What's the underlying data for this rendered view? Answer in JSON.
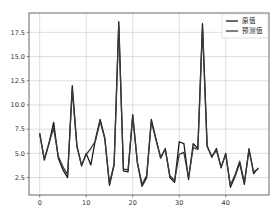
{
  "chart_data": {
    "type": "line",
    "title": "",
    "xlabel": "",
    "ylabel": "",
    "xlim": [
      -2.3,
      49.3
    ],
    "ylim": [
      0.7,
      19.5
    ],
    "grid": true,
    "legend_position": "upper right",
    "x_ticks": [
      0,
      10,
      20,
      30,
      40
    ],
    "x_tick_labels": [
      "0",
      "10",
      "20",
      "30",
      "40"
    ],
    "y_ticks": [
      2.5,
      5.0,
      7.5,
      10.0,
      12.5,
      15.0,
      17.5
    ],
    "y_tick_labels": [
      "2.5",
      "5.0",
      "7.5",
      "10.0",
      "12.5",
      "15.0",
      "17.5"
    ],
    "x": [
      0,
      1,
      2,
      3,
      4,
      5,
      6,
      7,
      8,
      9,
      10,
      11,
      12,
      13,
      14,
      15,
      16,
      17,
      18,
      19,
      20,
      21,
      22,
      23,
      24,
      25,
      26,
      27,
      28,
      29,
      30,
      31,
      32,
      33,
      34,
      35,
      36,
      37,
      38,
      39,
      40,
      41,
      42,
      43,
      44,
      45,
      46,
      47
    ],
    "series": [
      {
        "name": "原值",
        "color": "#1a1a1a",
        "values": [
          7.1,
          4.3,
          6.0,
          8.2,
          4.5,
          3.3,
          2.5,
          12.0,
          5.8,
          3.7,
          5.0,
          3.8,
          6.5,
          8.5,
          6.6,
          1.7,
          3.8,
          18.6,
          3.2,
          3.1,
          9.0,
          4.0,
          1.6,
          2.5,
          8.5,
          6.5,
          4.5,
          5.5,
          2.5,
          2.0,
          6.2,
          6.0,
          2.3,
          6.0,
          5.5,
          18.4,
          5.8,
          4.6,
          5.5,
          3.5,
          5.0,
          1.5,
          2.6,
          4.0,
          1.8,
          5.5,
          2.9,
          3.5
        ]
      },
      {
        "name": "预测值",
        "color": "#3a3a3a",
        "values": [
          7.0,
          4.4,
          6.1,
          7.6,
          4.7,
          3.6,
          2.8,
          11.6,
          5.7,
          3.8,
          4.9,
          5.5,
          6.3,
          8.3,
          6.5,
          1.9,
          3.9,
          18.2,
          3.4,
          3.3,
          8.8,
          4.1,
          1.8,
          2.7,
          8.3,
          6.4,
          4.6,
          5.4,
          2.7,
          2.2,
          4.9,
          5.1,
          2.5,
          5.6,
          5.4,
          18.0,
          5.7,
          4.7,
          5.3,
          3.6,
          4.9,
          1.7,
          2.8,
          4.2,
          2.0,
          5.3,
          3.1,
          3.4
        ]
      }
    ]
  },
  "legend": {
    "items": [
      {
        "label": "原值"
      },
      {
        "label": "预测值"
      }
    ]
  }
}
